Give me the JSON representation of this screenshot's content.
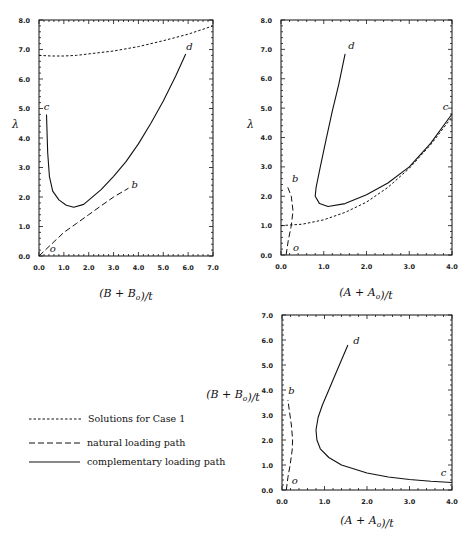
{
  "chart_data": [
    {
      "id": "top-left",
      "type": "line",
      "xlabel": "(B + B_o)/t",
      "ylabel": "λ",
      "xlim": [
        0,
        7
      ],
      "ylim": [
        0,
        8
      ],
      "xticks": [
        "0.0",
        "1.0",
        "2.0",
        "3.0",
        "4.0",
        "5.0",
        "6.0",
        "7.0"
      ],
      "yticks": [
        "0.0",
        "1.0",
        "2.0",
        "3.0",
        "4.0",
        "5.0",
        "6.0",
        "7.0",
        "8.0"
      ],
      "grid": false,
      "series": [
        {
          "name": "Solutions for Case 1",
          "style": "dotted",
          "points": [
            [
              0,
              6.8
            ],
            [
              0.5,
              6.78
            ],
            [
              1.0,
              6.78
            ],
            [
              1.5,
              6.8
            ],
            [
              2.0,
              6.85
            ],
            [
              3.0,
              6.95
            ],
            [
              4.0,
              7.1
            ],
            [
              5.0,
              7.3
            ],
            [
              6.0,
              7.52
            ],
            [
              7.0,
              7.8
            ]
          ]
        },
        {
          "name": "natural loading path",
          "style": "dashed",
          "points": [
            [
              0,
              0
            ],
            [
              0.5,
              0.4
            ],
            [
              1.0,
              0.8
            ],
            [
              1.5,
              1.1
            ],
            [
              2.0,
              1.4
            ],
            [
              2.5,
              1.7
            ],
            [
              3.0,
              2.0
            ],
            [
              3.6,
              2.3
            ]
          ]
        },
        {
          "name": "complementary loading path",
          "style": "solid",
          "points": [
            [
              0.3,
              4.8
            ],
            [
              0.35,
              3.5
            ],
            [
              0.42,
              2.7
            ],
            [
              0.55,
              2.2
            ],
            [
              0.8,
              1.9
            ],
            [
              1.1,
              1.72
            ],
            [
              1.4,
              1.65
            ],
            [
              1.8,
              1.75
            ],
            [
              2.5,
              2.25
            ],
            [
              3.0,
              2.7
            ],
            [
              3.5,
              3.2
            ],
            [
              4.0,
              3.8
            ],
            [
              4.5,
              4.5
            ],
            [
              5.0,
              5.25
            ],
            [
              5.5,
              6.1
            ],
            [
              5.9,
              6.85
            ]
          ]
        }
      ],
      "annotations": [
        {
          "text": "c",
          "x": 0.3,
          "y": 4.95
        },
        {
          "text": "d",
          "x": 6.05,
          "y": 7.0
        },
        {
          "text": "b",
          "x": 3.85,
          "y": 2.3
        },
        {
          "text": "o",
          "x": 0.55,
          "y": 0.15
        }
      ]
    },
    {
      "id": "top-right",
      "type": "line",
      "xlabel": "(A + A_o)/t",
      "ylabel": "λ",
      "xlim": [
        0,
        4
      ],
      "ylim": [
        0,
        8
      ],
      "xticks": [
        "0.0",
        "1.0",
        "2.0",
        "3.0",
        "4.0"
      ],
      "yticks": [
        "0.0",
        "1.0",
        "2.0",
        "3.0",
        "4.0",
        "5.0",
        "6.0",
        "7.0",
        "8.0"
      ],
      "grid": false,
      "series": [
        {
          "name": "Solutions for Case 1",
          "style": "dotted",
          "points": [
            [
              0,
              1.0
            ],
            [
              0.5,
              1.05
            ],
            [
              1.0,
              1.2
            ],
            [
              1.5,
              1.45
            ],
            [
              2.0,
              1.8
            ],
            [
              2.5,
              2.3
            ],
            [
              3.0,
              2.95
            ],
            [
              3.5,
              3.75
            ],
            [
              4.0,
              4.7
            ]
          ]
        },
        {
          "name": "natural loading path",
          "style": "dashed",
          "points": [
            [
              0.12,
              0
            ],
            [
              0.17,
              0.5
            ],
            [
              0.24,
              1.0
            ],
            [
              0.28,
              1.5
            ],
            [
              0.24,
              2.0
            ],
            [
              0.16,
              2.3
            ]
          ]
        },
        {
          "name": "complementary loading path",
          "style": "solid",
          "points": [
            [
              1.5,
              6.85
            ],
            [
              1.35,
              5.8
            ],
            [
              1.2,
              4.9
            ],
            [
              1.05,
              3.9
            ],
            [
              0.92,
              3.0
            ],
            [
              0.82,
              2.3
            ],
            [
              0.8,
              2.0
            ],
            [
              0.9,
              1.75
            ],
            [
              1.1,
              1.65
            ],
            [
              1.5,
              1.75
            ],
            [
              2.0,
              2.05
            ],
            [
              2.5,
              2.45
            ],
            [
              3.0,
              3.0
            ],
            [
              3.5,
              3.8
            ],
            [
              4.0,
              4.8
            ]
          ]
        }
      ],
      "annotations": [
        {
          "text": "d",
          "x": 1.65,
          "y": 7.0
        },
        {
          "text": "c",
          "x": 3.85,
          "y": 4.95
        },
        {
          "text": "b",
          "x": 0.33,
          "y": 2.5
        },
        {
          "text": "o",
          "x": 0.35,
          "y": 0.15
        }
      ]
    },
    {
      "id": "bottom-right",
      "type": "line",
      "xlabel": "(A + A_o)/t",
      "ylabel": "(B + B_o)/t",
      "xlim": [
        0,
        4
      ],
      "ylim": [
        0,
        7
      ],
      "xticks": [
        "0.0",
        "1.0",
        "2.0",
        "3.0",
        "4.0"
      ],
      "yticks": [
        "0.0",
        "1.0",
        "2.0",
        "3.0",
        "4.0",
        "5.0",
        "6.0",
        "7.0"
      ],
      "grid": false,
      "series": [
        {
          "name": "natural loading path",
          "style": "dashed",
          "points": [
            [
              0.1,
              0
            ],
            [
              0.14,
              0.5
            ],
            [
              0.19,
              1.0
            ],
            [
              0.24,
              1.6
            ],
            [
              0.25,
              2.0
            ],
            [
              0.22,
              2.6
            ],
            [
              0.18,
              3.1
            ],
            [
              0.14,
              3.6
            ]
          ]
        },
        {
          "name": "complementary loading path",
          "style": "solid",
          "points": [
            [
              1.55,
              5.8
            ],
            [
              1.4,
              5.2
            ],
            [
              1.25,
              4.6
            ],
            [
              1.1,
              4.0
            ],
            [
              0.95,
              3.4
            ],
            [
              0.85,
              2.9
            ],
            [
              0.8,
              2.4
            ],
            [
              0.82,
              2.0
            ],
            [
              0.9,
              1.65
            ],
            [
              1.1,
              1.3
            ],
            [
              1.4,
              1.0
            ],
            [
              2.0,
              0.68
            ],
            [
              2.5,
              0.52
            ],
            [
              3.0,
              0.42
            ],
            [
              3.5,
              0.35
            ],
            [
              4.0,
              0.3
            ]
          ]
        }
      ],
      "annotations": [
        {
          "text": "d",
          "x": 1.75,
          "y": 5.85
        },
        {
          "text": "b",
          "x": 0.22,
          "y": 3.85
        },
        {
          "text": "c",
          "x": 3.8,
          "y": 0.55
        },
        {
          "text": "o",
          "x": 0.3,
          "y": 0.25
        }
      ]
    }
  ],
  "legend": {
    "items": [
      {
        "style": "dotted",
        "label": "Solutions for Case 1"
      },
      {
        "style": "dashed",
        "label": "natural loading path"
      },
      {
        "style": "solid",
        "label": "complementary loading path"
      }
    ]
  },
  "colors": {
    "line": "#111111",
    "background": "#ffffff"
  }
}
